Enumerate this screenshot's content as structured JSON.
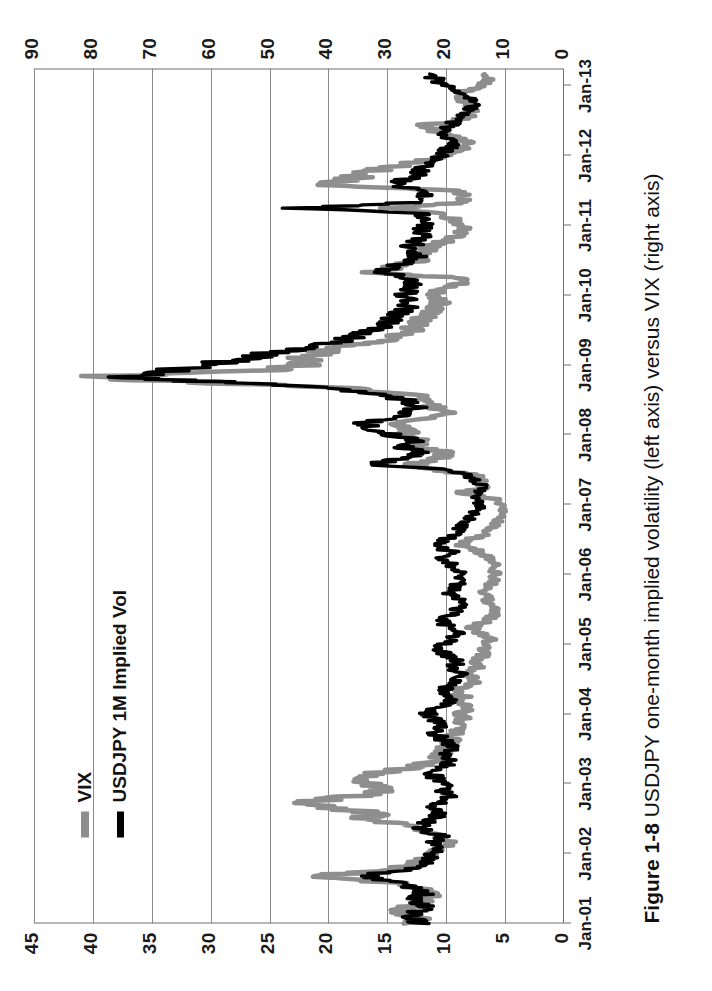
{
  "figure": {
    "number": "Figure 1-8",
    "caption": "USDJPY one-month implied volatility (left axis) versus VIX (right axis)"
  },
  "legend": {
    "position": "top-left-inside",
    "items": [
      {
        "label": "VIX",
        "color": "#8e8e8e",
        "axis": "right"
      },
      {
        "label": "USDJPY 1M Implied Vol",
        "color": "#000000",
        "axis": "left"
      }
    ]
  },
  "axes": {
    "left": {
      "title": "",
      "ticks": [
        "0",
        "5",
        "10",
        "15",
        "20",
        "25",
        "30",
        "35",
        "40",
        "45"
      ],
      "min": 0,
      "max": 45
    },
    "right": {
      "title": "",
      "ticks": [
        "0",
        "10",
        "20",
        "30",
        "40",
        "50",
        "60",
        "70",
        "80",
        "90"
      ],
      "min": 0,
      "max": 90
    },
    "x": {
      "title": "",
      "ticks": [
        "Jan-01",
        "Jan-02",
        "Jan-03",
        "Jan-04",
        "Jan-05",
        "Jan-06",
        "Jan-07",
        "Jan-08",
        "Jan-09",
        "Jan-10",
        "Jan-11",
        "Jan-12",
        "Jan-13"
      ]
    }
  },
  "chart_data": {
    "type": "line",
    "title": "USDJPY one-month implied volatility (left axis) versus VIX (right axis)",
    "xlabel": "",
    "ylabel": "",
    "grid": true,
    "legend_position": "top-left",
    "x_tick_labels": [
      "Jan-01",
      "Jan-02",
      "Jan-03",
      "Jan-04",
      "Jan-05",
      "Jan-06",
      "Jan-07",
      "Jan-08",
      "Jan-09",
      "Jan-10",
      "Jan-11",
      "Jan-12",
      "Jan-13"
    ],
    "ylim_left": [
      0,
      45
    ],
    "ylim_right": [
      0,
      90
    ],
    "ytick_left": [
      0,
      5,
      10,
      15,
      20,
      25,
      30,
      35,
      40,
      45
    ],
    "ytick_right": [
      0,
      10,
      20,
      30,
      40,
      50,
      60,
      70,
      80,
      90
    ],
    "series": [
      {
        "name": "USDJPY 1M Implied Vol",
        "axis": "left",
        "color": "#000000",
        "x": [
          2001.0,
          2001.08,
          2001.17,
          2001.25,
          2001.33,
          2001.42,
          2001.5,
          2001.58,
          2001.67,
          2001.75,
          2001.83,
          2001.92,
          2002.0,
          2002.08,
          2002.17,
          2002.25,
          2002.33,
          2002.42,
          2002.5,
          2002.58,
          2002.67,
          2002.75,
          2002.83,
          2002.92,
          2003.0,
          2003.08,
          2003.17,
          2003.25,
          2003.33,
          2003.42,
          2003.5,
          2003.58,
          2003.67,
          2003.75,
          2003.83,
          2003.92,
          2004.0,
          2004.08,
          2004.17,
          2004.25,
          2004.33,
          2004.42,
          2004.5,
          2004.58,
          2004.67,
          2004.75,
          2004.83,
          2004.92,
          2005.0,
          2005.08,
          2005.17,
          2005.25,
          2005.33,
          2005.42,
          2005.5,
          2005.58,
          2005.67,
          2005.75,
          2005.83,
          2005.92,
          2006.0,
          2006.08,
          2006.17,
          2006.25,
          2006.33,
          2006.42,
          2006.5,
          2006.58,
          2006.67,
          2006.75,
          2006.83,
          2006.92,
          2007.0,
          2007.08,
          2007.17,
          2007.25,
          2007.33,
          2007.42,
          2007.5,
          2007.58,
          2007.67,
          2007.75,
          2007.83,
          2007.92,
          2008.0,
          2008.08,
          2008.17,
          2008.25,
          2008.33,
          2008.42,
          2008.5,
          2008.58,
          2008.67,
          2008.75,
          2008.83,
          2008.92,
          2009.0,
          2009.08,
          2009.17,
          2009.25,
          2009.33,
          2009.42,
          2009.5,
          2009.58,
          2009.67,
          2009.75,
          2009.83,
          2009.92,
          2010.0,
          2010.08,
          2010.17,
          2010.25,
          2010.33,
          2010.42,
          2010.5,
          2010.58,
          2010.67,
          2010.75,
          2010.83,
          2010.92,
          2011.0,
          2011.08,
          2011.17,
          2011.25,
          2011.33,
          2011.42,
          2011.5,
          2011.58,
          2011.67,
          2011.75,
          2011.83,
          2011.92,
          2012.0,
          2012.08,
          2012.17,
          2012.25,
          2012.33,
          2012.42,
          2012.5,
          2012.58,
          2012.67,
          2012.75,
          2012.83,
          2012.92,
          2013.0,
          2013.08,
          2013.17
        ],
        "values": [
          12.2,
          13.0,
          12.4,
          11.6,
          12.8,
          11.9,
          12.6,
          13.4,
          17.5,
          14.2,
          12.3,
          11.4,
          11.0,
          10.6,
          11.3,
          10.4,
          11.8,
          12.2,
          11.2,
          10.5,
          11.0,
          10.2,
          9.8,
          10.4,
          10.0,
          10.8,
          11.4,
          10.2,
          9.6,
          10.0,
          9.4,
          9.8,
          10.6,
          11.2,
          10.4,
          11.0,
          11.6,
          10.8,
          10.0,
          9.6,
          10.4,
          9.8,
          9.2,
          8.8,
          9.4,
          9.0,
          9.8,
          10.6,
          10.2,
          9.4,
          9.0,
          9.8,
          10.4,
          9.6,
          9.0,
          8.6,
          9.2,
          9.8,
          9.2,
          8.8,
          8.4,
          9.0,
          9.8,
          10.4,
          9.6,
          11.2,
          10.2,
          9.4,
          8.8,
          8.2,
          7.8,
          7.4,
          7.0,
          7.6,
          7.2,
          6.8,
          7.4,
          8.2,
          9.6,
          16.2,
          13.4,
          12.0,
          13.8,
          12.2,
          14.6,
          15.8,
          17.4,
          14.2,
          13.0,
          12.4,
          13.6,
          15.2,
          19.8,
          28.4,
          38.6,
          34.2,
          30.6,
          27.4,
          24.8,
          22.0,
          19.6,
          17.8,
          16.4,
          15.2,
          14.6,
          14.0,
          13.4,
          13.0,
          13.8,
          13.2,
          12.6,
          13.4,
          15.6,
          14.2,
          13.0,
          12.4,
          13.2,
          12.6,
          12.0,
          12.4,
          11.8,
          12.2,
          11.6,
          22.4,
          12.8,
          12.0,
          11.4,
          14.8,
          13.2,
          12.4,
          11.8,
          11.2,
          10.6,
          10.0,
          9.4,
          9.8,
          10.4,
          9.8,
          9.2,
          8.6,
          8.0,
          7.6,
          8.2,
          8.8,
          9.6,
          10.8,
          11.4
        ]
      },
      {
        "name": "VIX",
        "axis": "right",
        "color": "#8e8e8e",
        "x": [
          2001.0,
          2001.08,
          2001.17,
          2001.25,
          2001.33,
          2001.42,
          2001.5,
          2001.58,
          2001.67,
          2001.75,
          2001.83,
          2001.92,
          2002.0,
          2002.08,
          2002.17,
          2002.25,
          2002.33,
          2002.42,
          2002.5,
          2002.58,
          2002.67,
          2002.75,
          2002.83,
          2002.92,
          2003.0,
          2003.08,
          2003.17,
          2003.25,
          2003.33,
          2003.42,
          2003.5,
          2003.58,
          2003.67,
          2003.75,
          2003.83,
          2003.92,
          2004.0,
          2004.08,
          2004.17,
          2004.25,
          2004.33,
          2004.42,
          2004.5,
          2004.58,
          2004.67,
          2004.75,
          2004.83,
          2004.92,
          2005.0,
          2005.08,
          2005.17,
          2005.25,
          2005.33,
          2005.42,
          2005.5,
          2005.58,
          2005.67,
          2005.75,
          2005.83,
          2005.92,
          2006.0,
          2006.08,
          2006.17,
          2006.25,
          2006.33,
          2006.42,
          2006.5,
          2006.58,
          2006.67,
          2006.75,
          2006.83,
          2006.92,
          2007.0,
          2007.08,
          2007.17,
          2007.25,
          2007.33,
          2007.42,
          2007.5,
          2007.58,
          2007.67,
          2007.75,
          2007.83,
          2007.92,
          2008.0,
          2008.08,
          2008.17,
          2008.25,
          2008.33,
          2008.42,
          2008.5,
          2008.58,
          2008.67,
          2008.75,
          2008.83,
          2008.92,
          2009.0,
          2009.08,
          2009.17,
          2009.25,
          2009.33,
          2009.42,
          2009.5,
          2009.58,
          2009.67,
          2009.75,
          2009.83,
          2009.92,
          2010.0,
          2010.08,
          2010.17,
          2010.25,
          2010.33,
          2010.42,
          2010.5,
          2010.58,
          2010.67,
          2010.75,
          2010.83,
          2010.92,
          2011.0,
          2011.08,
          2011.17,
          2011.25,
          2011.33,
          2011.42,
          2011.5,
          2011.58,
          2011.67,
          2011.75,
          2011.83,
          2011.92,
          2012.0,
          2012.08,
          2012.17,
          2012.25,
          2012.33,
          2012.42,
          2012.5,
          2012.58,
          2012.67,
          2012.75,
          2012.83,
          2012.92,
          2013.0,
          2013.08,
          2013.17
        ],
        "values": [
          26.0,
          24.5,
          28.0,
          26.5,
          24.0,
          22.5,
          24.0,
          28.0,
          43.7,
          32.0,
          26.0,
          23.5,
          22.0,
          21.5,
          19.0,
          22.0,
          24.0,
          27.0,
          34.0,
          32.0,
          40.0,
          43.2,
          35.0,
          30.0,
          33.0,
          34.5,
          31.0,
          25.0,
          22.0,
          21.0,
          20.5,
          19.5,
          19.0,
          18.0,
          17.5,
          17.0,
          17.5,
          16.5,
          18.0,
          17.0,
          19.0,
          16.0,
          15.0,
          17.5,
          14.5,
          15.5,
          14.0,
          13.5,
          13.0,
          12.5,
          14.5,
          16.0,
          13.0,
          12.0,
          11.5,
          12.5,
          13.0,
          14.0,
          12.5,
          12.0,
          11.5,
          12.0,
          12.0,
          13.0,
          14.5,
          18.0,
          16.0,
          13.5,
          12.0,
          11.5,
          11.0,
          10.5,
          11.0,
          11.5,
          17.5,
          13.5,
          14.0,
          15.0,
          22.0,
          26.0,
          21.0,
          20.0,
          26.0,
          23.5,
          27.0,
          26.5,
          29.0,
          22.0,
          19.0,
          23.0,
          22.0,
          25.0,
          38.0,
          59.0,
          80.9,
          52.0,
          45.0,
          44.0,
          42.0,
          38.0,
          32.0,
          28.0,
          26.0,
          25.0,
          24.0,
          22.5,
          21.5,
          21.0,
          22.0,
          21.0,
          17.5,
          18.0,
          32.0,
          28.0,
          25.0,
          24.0,
          23.5,
          21.0,
          18.5,
          17.5,
          17.0,
          19.0,
          20.5,
          29.0,
          17.0,
          16.5,
          18.0,
          43.0,
          36.0,
          34.0,
          30.0,
          24.0,
          20.0,
          18.0,
          16.0,
          17.5,
          20.0,
          25.0,
          18.0,
          16.0,
          15.0,
          16.0,
          17.5,
          17.0,
          14.5,
          13.0,
          13.5
        ]
      }
    ],
    "annotations": [
      {
        "text": "peak of 2008 crisis",
        "x": "2008-10",
        "usdjpy_1m_vol": 38.6,
        "vix": 80.9
      }
    ]
  }
}
